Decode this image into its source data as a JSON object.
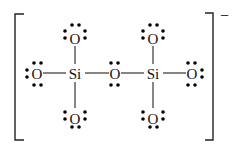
{
  "diagram": {
    "type": "lewis-structure",
    "species": "disilicate anion",
    "charge_label": "−",
    "atoms": [
      {
        "id": "O_top_left",
        "label": "O",
        "x": 75,
        "y": 38
      },
      {
        "id": "O_top_right",
        "label": "O",
        "x": 153,
        "y": 38
      },
      {
        "id": "O_left",
        "label": "O",
        "x": 37,
        "y": 74
      },
      {
        "id": "Si_left",
        "label": "Si",
        "x": 75,
        "y": 74
      },
      {
        "id": "O_bridge",
        "label": "O",
        "x": 115,
        "y": 74
      },
      {
        "id": "Si_right",
        "label": "Si",
        "x": 153,
        "y": 74
      },
      {
        "id": "O_right",
        "label": "O",
        "x": 192,
        "y": 74
      },
      {
        "id": "O_bottom_left",
        "label": "O",
        "x": 75,
        "y": 118
      },
      {
        "id": "O_bottom_right",
        "label": "O",
        "x": 153,
        "y": 118
      }
    ],
    "bonds": [
      [
        "O_top_left",
        "Si_left"
      ],
      [
        "O_top_right",
        "Si_right"
      ],
      [
        "O_left",
        "Si_left"
      ],
      [
        "Si_left",
        "O_bridge"
      ],
      [
        "O_bridge",
        "Si_right"
      ],
      [
        "Si_right",
        "O_right"
      ],
      [
        "Si_left",
        "O_bottom_left"
      ],
      [
        "Si_right",
        "O_bottom_right"
      ]
    ],
    "lone_pairs": {
      "O_top_left": [
        "top",
        "left",
        "right"
      ],
      "O_top_right": [
        "top",
        "left",
        "right"
      ],
      "O_left": [
        "top",
        "left",
        "bottom"
      ],
      "O_bridge": [
        "top",
        "bottom"
      ],
      "O_right": [
        "top",
        "right",
        "bottom"
      ],
      "O_bottom_left": [
        "left",
        "right",
        "bottom"
      ],
      "O_bottom_right": [
        "left",
        "right",
        "bottom"
      ]
    }
  }
}
